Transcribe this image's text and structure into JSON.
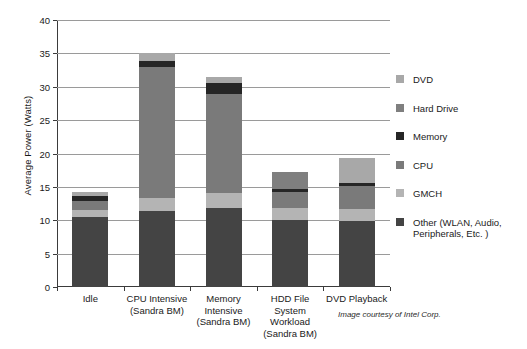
{
  "chart_data": {
    "type": "bar",
    "stacked": true,
    "title": "",
    "xlabel": "",
    "ylabel": "Average Power (Watts)",
    "ylim": [
      0,
      40
    ],
    "ytick_step": 5,
    "ytick_labels": [
      "0",
      "5",
      "10",
      "15",
      "20",
      "25",
      "30",
      "35",
      "40"
    ],
    "grid": true,
    "legend_position": "right",
    "categories": [
      "Idle",
      "CPU Intensive\n(Sandra BM)",
      "Memory Intensive\n(Sandra BM)",
      "HDD File System Workload\n(Sandra BM)",
      "DVD Playback"
    ],
    "category_lines": [
      [
        "Idle"
      ],
      [
        "CPU Intensive",
        "(Sandra BM)"
      ],
      [
        "Memory",
        "Intensive",
        "(Sandra BM)"
      ],
      [
        "HDD File",
        "System",
        "Workload",
        "(Sandra BM)"
      ],
      [
        "DVD Playback"
      ]
    ],
    "series": [
      {
        "name": "Other (WLAN, Audio, Peripherals, Etc. )",
        "color": "#444444",
        "values": [
          10.5,
          11.4,
          11.9,
          10.0,
          9.9
        ]
      },
      {
        "name": "GMCH",
        "color": "#b4b4b4",
        "values": [
          1.1,
          2.0,
          2.2,
          1.8,
          1.8
        ]
      },
      {
        "name": "CPU",
        "color": "#7a7a7a",
        "values": [
          1.3,
          19.5,
          14.8,
          2.5,
          3.5
        ]
      },
      {
        "name": "Memory",
        "color": "#262626",
        "values": [
          0.7,
          0.9,
          1.7,
          0.4,
          0.4
        ]
      },
      {
        "name": "Hard Drive",
        "color": "#7f7f7f",
        "values": [
          0.0,
          0.0,
          0.0,
          2.5,
          0.0
        ]
      },
      {
        "name": "DVD",
        "color": "#a8a8a8",
        "values": [
          0.7,
          1.2,
          0.9,
          0.0,
          3.8
        ]
      }
    ],
    "totals": [
      14.3,
      35.0,
      31.5,
      17.2,
      19.4
    ]
  },
  "legend": {
    "entries": [
      {
        "label": "DVD",
        "color": "#a8a8a8"
      },
      {
        "label": "Hard Drive",
        "color": "#7f7f7f"
      },
      {
        "label": "Memory",
        "color": "#262626"
      },
      {
        "label": "CPU",
        "color": "#7a7a7a"
      },
      {
        "label": "GMCH",
        "color": "#b4b4b4"
      },
      {
        "label": "Other (WLAN, Audio,",
        "label2": "Peripherals, Etc. )",
        "color": "#444444"
      }
    ]
  },
  "credit": "Image courtesy of Intel Corp."
}
